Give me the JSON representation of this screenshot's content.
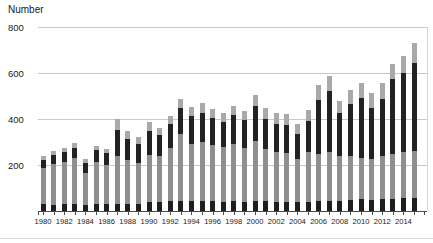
{
  "chart_data": {
    "type": "bar",
    "stacked": true,
    "title": "",
    "ylabel": "Number",
    "xlabel": "",
    "ylim": [
      0,
      800
    ],
    "y_gridlines": [
      200,
      400,
      600,
      800
    ],
    "grid": true,
    "legend": "none",
    "x_tick_labels_shown_every": 2,
    "categories": [
      1980,
      1981,
      1982,
      1983,
      1984,
      1985,
      1986,
      1987,
      1988,
      1989,
      1990,
      1991,
      1992,
      1993,
      1994,
      1995,
      1996,
      1997,
      1998,
      1999,
      2000,
      2001,
      2002,
      2003,
      2004,
      2005,
      2006,
      2007,
      2008,
      2009,
      2010,
      2011,
      2012,
      2013,
      2014,
      2015
    ],
    "series": [
      {
        "name": "segment-bottom-black",
        "color": "#1e1e1e",
        "values": [
          32,
          28,
          31,
          32,
          28,
          29,
          29,
          30,
          30,
          30,
          40,
          40,
          44,
          44,
          42,
          42,
          42,
          40,
          42,
          40,
          44,
          42,
          40,
          40,
          38,
          40,
          45,
          45,
          45,
          48,
          54,
          49,
          54,
          52,
          55,
          55
        ]
      },
      {
        "name": "segment-mid-gray",
        "color": "#8f8f8f",
        "values": [
          154,
          176,
          180,
          197,
          138,
          185,
          173,
          209,
          190,
          180,
          205,
          198,
          232,
          289,
          250,
          260,
          245,
          237,
          250,
          235,
          262,
          226,
          215,
          212,
          190,
          215,
          203,
          210,
          195,
          190,
          175,
          177,
          186,
          198,
          200,
          205
        ]
      },
      {
        "name": "segment-upper-black",
        "color": "#222222",
        "values": [
          37,
          41,
          46,
          47,
          42,
          51,
          50,
          115,
          95,
          82,
          105,
          93,
          103,
          115,
          120,
          125,
          118,
          112,
          126,
          120,
          149,
          130,
          124,
          122,
          108,
          136,
          236,
          266,
          188,
          227,
          261,
          222,
          246,
          325,
          345,
          383
        ]
      },
      {
        "name": "segment-top-gray",
        "color": "#a9a9a9",
        "values": [
          17,
          17,
          18,
          19,
          17,
          18,
          18,
          46,
          33,
          28,
          35,
          29,
          33,
          40,
          40,
          41,
          40,
          38,
          40,
          40,
          50,
          50,
          48,
          48,
          43,
          50,
          64,
          64,
          50,
          60,
          65,
          65,
          70,
          65,
          72,
          87
        ]
      }
    ],
    "totals": [
      240,
      262,
      275,
      295,
      225,
      283,
      270,
      400,
      348,
      320,
      385,
      360,
      412,
      488,
      452,
      468,
      445,
      427,
      458,
      435,
      505,
      448,
      427,
      422,
      379,
      441,
      548,
      585,
      478,
      525,
      555,
      513,
      556,
      640,
      672,
      730
    ]
  },
  "axis": {
    "y_ticks": [
      "200",
      "400",
      "600",
      "800"
    ],
    "x_labels": [
      "1980",
      "1982",
      "1984",
      "1986",
      "1988",
      "1990",
      "1992",
      "1994",
      "1996",
      "1998",
      "2000",
      "2002",
      "2004",
      "2006",
      "2008",
      "2010",
      "2012",
      "2014"
    ]
  },
  "colors": {
    "background": "#ffffff",
    "gridline": "#c9c9c9",
    "axis_line": "#4a4a4a",
    "text": "#1a1a1a"
  }
}
